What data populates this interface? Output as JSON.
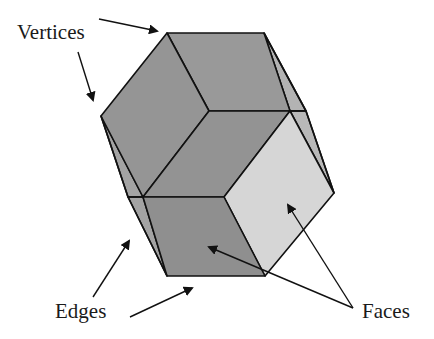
{
  "diagram": {
    "labels": {
      "vertices": "Vertices",
      "edges": "Edges",
      "faces": "Faces"
    },
    "colors": {
      "background": "#ffffff",
      "face_dark": "#8f8f8f",
      "face_mid": "#9a9a9a",
      "face_side": "#b3b3b3",
      "face_light": "#d6d6d6",
      "edge_stroke": "#111111",
      "text": "#1a1a1a"
    },
    "callouts": [
      {
        "label": "Vertices",
        "arrows": 2
      },
      {
        "label": "Edges",
        "arrows": 2
      },
      {
        "label": "Faces",
        "arrows": 2
      }
    ]
  }
}
